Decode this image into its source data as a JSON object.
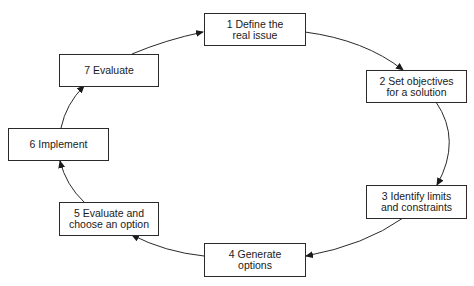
{
  "diagram": {
    "type": "cycle",
    "steps": [
      {
        "id": 1,
        "label": "1  Define the\nreal issue"
      },
      {
        "id": 2,
        "label": "2  Set objectives\nfor a solution"
      },
      {
        "id": 3,
        "label": "3  Identify limits\nand constraints"
      },
      {
        "id": 4,
        "label": "4  Generate\noptions"
      },
      {
        "id": 5,
        "label": "5  Evaluate and\nchoose an option"
      },
      {
        "id": 6,
        "label": "6  Implement"
      },
      {
        "id": 7,
        "label": "7  Evaluate"
      }
    ],
    "edges": [
      {
        "from": 1,
        "to": 2
      },
      {
        "from": 2,
        "to": 3
      },
      {
        "from": 3,
        "to": 4
      },
      {
        "from": 4,
        "to": 5
      },
      {
        "from": 5,
        "to": 6
      },
      {
        "from": 6,
        "to": 7
      },
      {
        "from": 7,
        "to": 1
      }
    ],
    "colors": {
      "line": "#2a2a2a",
      "box_border": "#2a2a2a",
      "background": "#ffffff"
    }
  }
}
